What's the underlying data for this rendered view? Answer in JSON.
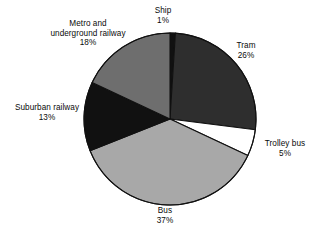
{
  "chart_data": {
    "type": "pie",
    "title": "",
    "subtitle": "",
    "xlabel": "",
    "ylabel": "",
    "legend_position": "none",
    "grid": false,
    "units": "percent",
    "total": 100,
    "start_angle_deg": 0,
    "direction": "clockwise",
    "categories": [
      "Ship",
      "Tram",
      "Trolley bus",
      "Bus",
      "Suburban railway",
      "Metro and underground railway"
    ],
    "values": [
      1,
      26,
      5,
      37,
      13,
      18
    ],
    "slices": [
      {
        "name": "ship",
        "label": "Ship",
        "label_line1": "Ship",
        "label_line2": "",
        "percent_text": "1%",
        "value": 1,
        "color": "#111111"
      },
      {
        "name": "tram",
        "label": "Tram",
        "label_line1": "Tram",
        "label_line2": "",
        "percent_text": "26%",
        "value": 26,
        "color": "#2e2e2e"
      },
      {
        "name": "trolley-bus",
        "label": "Trolley bus",
        "label_line1": "Trolley bus",
        "label_line2": "",
        "percent_text": "5%",
        "value": 5,
        "color": "#ffffff"
      },
      {
        "name": "bus",
        "label": "Bus",
        "label_line1": "Bus",
        "label_line2": "",
        "percent_text": "37%",
        "value": 37,
        "color": "#a8a8a8"
      },
      {
        "name": "suburban-railway",
        "label": "Suburban railway",
        "label_line1": "Suburban railway",
        "label_line2": "",
        "percent_text": "13%",
        "value": 13,
        "color": "#111111"
      },
      {
        "name": "metro-underground-railway",
        "label": "Metro and underground railway",
        "label_line1": "Metro and",
        "label_line2": "underground railway",
        "percent_text": "18%",
        "value": 18,
        "color": "#6e6e6e"
      }
    ],
    "geometry": {
      "center_x": 170,
      "center_y": 119,
      "radius": 86,
      "stroke_color": "#111111",
      "stroke_width": 1.1
    },
    "colors": {
      "background": "#ffffff",
      "text": "#0a0a0a",
      "outline": "#111111"
    }
  }
}
